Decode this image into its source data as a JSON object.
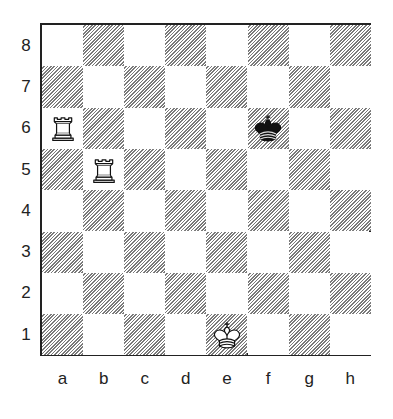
{
  "diagram": {
    "type": "chess-position",
    "files": [
      "a",
      "b",
      "c",
      "d",
      "e",
      "f",
      "g",
      "h"
    ],
    "ranks": [
      "8",
      "7",
      "6",
      "5",
      "4",
      "3",
      "2",
      "1"
    ],
    "pieces": [
      {
        "square": "a6",
        "color": "white",
        "piece": "rook",
        "icon": "white-rook-icon"
      },
      {
        "square": "b5",
        "color": "white",
        "piece": "rook",
        "icon": "white-rook-icon"
      },
      {
        "square": "f6",
        "color": "black",
        "piece": "king",
        "icon": "black-king-icon"
      },
      {
        "square": "e1",
        "color": "white",
        "piece": "king",
        "icon": "white-king-icon"
      }
    ],
    "colors": {
      "border": "#222222",
      "light_square": "#ffffff",
      "dark_square_hatch": "#7a7a7a"
    }
  }
}
